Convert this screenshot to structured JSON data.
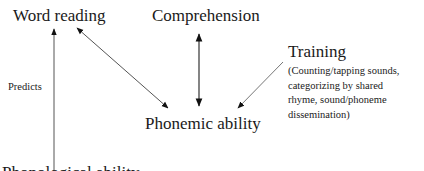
{
  "nodes": {
    "word_reading": "Word reading",
    "comprehension": "Comprehension",
    "training": "Training",
    "training_detail": [
      "(Counting/tapping sounds,",
      "categorizing by shared",
      "rhyme, sound/phoneme",
      "dissemination)"
    ],
    "phonemic_ability": "Phonemic ability",
    "predicts": "Predicts",
    "bottom_cut_text": "Phonological ability"
  },
  "edges": [
    {
      "from": "bottom_cut_text",
      "to": "word_reading",
      "label": "Predicts",
      "type": "single-arrow"
    },
    {
      "from": "phonemic_ability",
      "to": "word_reading",
      "type": "double-arrow"
    },
    {
      "from": "phonemic_ability",
      "to": "comprehension",
      "type": "double-arrow"
    },
    {
      "from": "training",
      "to": "phonemic_ability",
      "type": "single-arrow"
    }
  ],
  "colors": {
    "text": "#1a1a1a",
    "line": "#444444"
  }
}
